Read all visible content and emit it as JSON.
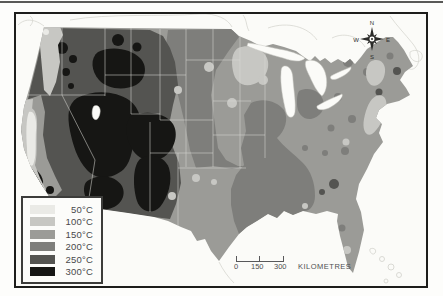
{
  "legend": {
    "items": [
      {
        "label": "50°C",
        "color": "#eaeae6"
      },
      {
        "label": "100°C",
        "color": "#c7c7c3"
      },
      {
        "label": "150°C",
        "color": "#9b9b97"
      },
      {
        "label": "200°C",
        "color": "#7e7e7b"
      },
      {
        "label": "250°C",
        "color": "#545451"
      },
      {
        "label": "300°C",
        "color": "#161614"
      }
    ]
  },
  "compass": {
    "north": "N",
    "east": "E",
    "south": "S",
    "west": "W"
  },
  "scale_bar": {
    "tick_labels": [
      "0",
      "150",
      "300"
    ],
    "unit_label": "KILOMETRES"
  },
  "colors": {
    "c50": "#eaeae6",
    "c100": "#c7c7c3",
    "c150": "#9b9b97",
    "c200": "#7e7e7b",
    "c250": "#545451",
    "c300": "#161614",
    "water": "#fbfbf8",
    "compass_ink": "#2b2b29"
  }
}
